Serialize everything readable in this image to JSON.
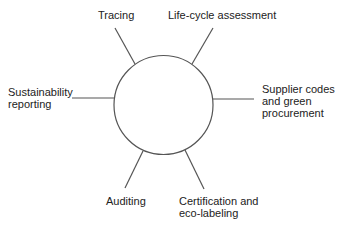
{
  "diagram": {
    "center": {
      "label": ""
    },
    "nodes": [
      {
        "id": "tracing",
        "lines": [
          "Tracing"
        ]
      },
      {
        "id": "life-cycle-assessment",
        "lines": [
          "Life-cycle assessment"
        ]
      },
      {
        "id": "supplier-codes",
        "lines": [
          "Supplier codes",
          "and green",
          "procurement"
        ]
      },
      {
        "id": "certification",
        "lines": [
          "Certification and",
          "eco-labeling"
        ]
      },
      {
        "id": "auditing",
        "lines": [
          "Auditing"
        ]
      },
      {
        "id": "sustainability-reporting",
        "lines": [
          "Sustainability",
          "reporting"
        ]
      }
    ],
    "colors": {
      "stroke": "#555555",
      "text": "#222222",
      "background": "#ffffff"
    }
  }
}
